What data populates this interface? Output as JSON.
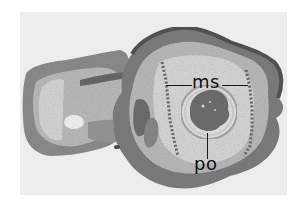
{
  "figure": {
    "labels": [
      {
        "id": "ms",
        "text": "ms"
      },
      {
        "id": "po",
        "text": "po"
      }
    ]
  },
  "colors": {
    "background": "#ffffff",
    "plate": "#ededed",
    "tissue_light": "#d6d6d6",
    "tissue_mid": "#9a9a9a",
    "tissue_dark": "#555555",
    "label": "#111111"
  }
}
